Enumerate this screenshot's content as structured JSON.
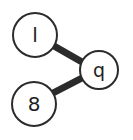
{
  "canvas": {
    "width": 133,
    "height": 140,
    "background_color": "#ffffff"
  },
  "style": {
    "node_fill": "#ffffff",
    "node_stroke": "#2b2b2b",
    "node_stroke_width": 2,
    "edge_color": "#2b2b2b",
    "edge_width": 7,
    "label_color": "#1e1e1e"
  },
  "chart_data": {
    "type": "diagram",
    "title": "",
    "layout": "node-link graph",
    "nodes": [
      {
        "id": "n1",
        "label": "l",
        "cx": 35,
        "cy": 35,
        "r": 22,
        "font_size": 20
      },
      {
        "id": "n2",
        "label": "8",
        "cx": 34,
        "cy": 104,
        "r": 22,
        "font_size": 20
      },
      {
        "id": "n3",
        "label": "q",
        "cx": 99,
        "cy": 70,
        "r": 19,
        "font_size": 19
      }
    ],
    "edges": [
      {
        "id": "e1",
        "from": "l",
        "to": "q",
        "x1": 54,
        "y1": 46,
        "x2": 82,
        "y2": 62
      },
      {
        "id": "e2",
        "from": "8",
        "to": "q",
        "x1": 53,
        "y1": 93,
        "x2": 82,
        "y2": 78
      }
    ]
  }
}
